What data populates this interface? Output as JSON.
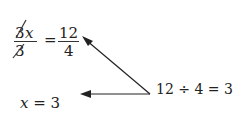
{
  "equation": {
    "left_numerator_coef": "3",
    "left_numerator_var": "x",
    "left_denominator": "3",
    "equals": "=",
    "right_numerator": "12",
    "right_denominator": "4"
  },
  "division_note": "12 ÷ 4 = 3",
  "result": {
    "var": "x",
    "rest": " = 3"
  },
  "colors": {
    "ink": "#222222"
  }
}
